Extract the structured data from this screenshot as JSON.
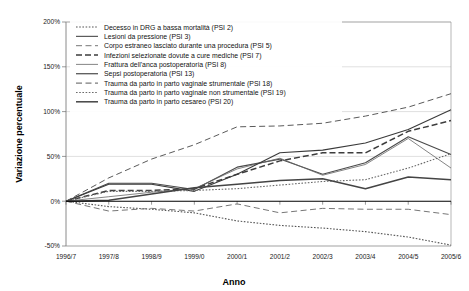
{
  "chart_data": {
    "type": "line",
    "title": "",
    "xlabel": "Anno",
    "ylabel": "Variazione percentuale",
    "categories": [
      "1996/7",
      "1997/8",
      "1998/9",
      "1999/0",
      "2000/1",
      "2001/2",
      "2002/3",
      "2003/4",
      "2004/5",
      "2005/6"
    ],
    "ytick_labels": [
      "200%",
      "150%",
      "100%",
      "50%",
      "0%",
      "-50%"
    ],
    "ytick_values": [
      200,
      150,
      100,
      50,
      0,
      -50
    ],
    "ylim": [
      -50,
      200
    ],
    "grid": "horizontal",
    "legend_position": "top-left-inside",
    "series": [
      {
        "name": "Decesso in DRG a bassa mortalità (PSI 2)",
        "style": "dotted",
        "color": "#555555",
        "values": [
          0,
          -6,
          -9,
          -13,
          -22,
          -27,
          -30,
          -34,
          -40,
          -49
        ]
      },
      {
        "name": "Lesioni da pressione (PSI 3)",
        "style": "solid",
        "color": "#4a4a4a",
        "values": [
          0,
          20,
          20,
          13,
          38,
          47,
          30,
          43,
          72,
          52
        ]
      },
      {
        "name": "Corpo estraneo lasciato durante una procedura (PSI 5)",
        "style": "dashed-long",
        "color": "#777777",
        "values": [
          0,
          -11,
          -8,
          -11,
          -3,
          -13,
          -8,
          -9,
          -9,
          -15
        ]
      },
      {
        "name": "Infezioni selezionate dovute a cure mediche (PSI 7)",
        "style": "dashed-heavy",
        "color": "#3d3d3d",
        "values": [
          0,
          12,
          12,
          14,
          30,
          45,
          54,
          54,
          78,
          90
        ]
      },
      {
        "name": "Frattura dell'anca postoperatoria (PSI 8)",
        "style": "solid-thin",
        "color": "#666666",
        "values": [
          0,
          5,
          10,
          14,
          36,
          48,
          29,
          41,
          70,
          37
        ]
      },
      {
        "name": "Sepsi postoperatoria (PSI 13)",
        "style": "solid",
        "color": "#3a3a3a",
        "values": [
          0,
          19,
          19,
          11,
          30,
          54,
          57,
          65,
          80,
          102
        ]
      },
      {
        "name": "Trauma da parto in parto vaginale strumentale (PSI 18)",
        "style": "dashed-long",
        "color": "#5a5a5a",
        "values": [
          0,
          26,
          47,
          63,
          83,
          84,
          87,
          95,
          105,
          120
        ]
      },
      {
        "name": "Trauma da parto in parto vaginale non strumentale (PSI 19)",
        "style": "dotted",
        "color": "#6b6b6b",
        "values": [
          0,
          11,
          11,
          12,
          14,
          18,
          22,
          24,
          37,
          53
        ]
      },
      {
        "name": "Trauma da parto in parto cesareo (PSI 20)",
        "style": "solid-thick",
        "color": "#444444",
        "values": [
          0,
          1,
          8,
          15,
          19,
          23,
          25,
          14,
          27,
          24
        ]
      }
    ]
  }
}
